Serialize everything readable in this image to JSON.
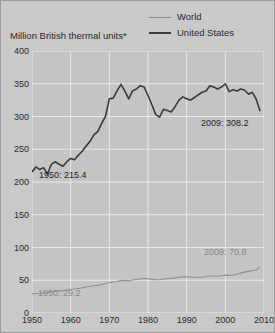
{
  "figure": {
    "axis_title": "Million British thermal units*",
    "background_color": "#c9c9c9",
    "plot_background_color": "#c4c4c4",
    "gridline_color": "#e8e8e8"
  },
  "legend": {
    "position": "top-right",
    "items": [
      {
        "label": "World",
        "color": "#8e8e8e",
        "swatch": "line-swatch-world"
      },
      {
        "label": "United States",
        "color": "#3a3a3a",
        "swatch": "line-swatch-united-states"
      }
    ]
  },
  "annotations": [
    {
      "name": "us-series-start-value",
      "text": "1950: 215.4",
      "color": "#1d1d1d",
      "series": "United States",
      "year": 1950,
      "value": 215.4
    },
    {
      "name": "us-series-end-value",
      "text": "2009: 308.2",
      "color": "#1d1d1d",
      "series": "United States",
      "year": 2009,
      "value": 308.2
    },
    {
      "name": "world-series-end-value",
      "text": "2009: 70.8",
      "color": "#8a8a8a",
      "series": "World",
      "year": 2009,
      "value": 70.8
    },
    {
      "name": "world-series-start-value",
      "text": "1950: 29.2",
      "color": "#8a8a8a",
      "series": "World",
      "year": 1950,
      "value": 29.2
    }
  ],
  "chart_data": {
    "type": "line",
    "title": "",
    "subtitle": "",
    "xlabel": "",
    "ylabel": "Million British thermal units*",
    "xlim": [
      1950,
      2010
    ],
    "ylim": [
      0,
      400
    ],
    "yticks": [
      0,
      50,
      100,
      150,
      200,
      250,
      300,
      350,
      400
    ],
    "xticks": [
      1950,
      1960,
      1970,
      1980,
      1990,
      2000,
      2010
    ],
    "grid": true,
    "legend_position": "upper right",
    "footnote_marker": "*",
    "x": [
      1950,
      1951,
      1952,
      1953,
      1954,
      1955,
      1956,
      1957,
      1958,
      1959,
      1960,
      1961,
      1962,
      1963,
      1964,
      1965,
      1966,
      1967,
      1968,
      1969,
      1970,
      1971,
      1972,
      1973,
      1974,
      1975,
      1976,
      1977,
      1978,
      1979,
      1980,
      1981,
      1982,
      1983,
      1984,
      1985,
      1986,
      1987,
      1988,
      1989,
      1990,
      1991,
      1992,
      1993,
      1994,
      1995,
      1996,
      1997,
      1998,
      1999,
      2000,
      2001,
      2002,
      2003,
      2004,
      2005,
      2006,
      2007,
      2008,
      2009
    ],
    "series": [
      {
        "name": "United States",
        "color": "#3a3a3a",
        "width": 1.6,
        "values": [
          215.4,
          223.0,
          219.0,
          222.0,
          212.0,
          227.0,
          231.0,
          227.0,
          224.0,
          231.0,
          236.0,
          234.0,
          241.0,
          247.0,
          255.0,
          262.0,
          272.0,
          277.0,
          289.0,
          300.0,
          327.0,
          328.0,
          339.0,
          349.0,
          339.0,
          327.0,
          339.0,
          342.0,
          347.0,
          345.0,
          332.0,
          318.0,
          303.0,
          299.0,
          311.0,
          309.0,
          307.0,
          315.0,
          325.0,
          330.0,
          327.0,
          325.0,
          329.0,
          333.0,
          337.0,
          339.0,
          347.0,
          345.0,
          342.0,
          345.0,
          350.0,
          338.0,
          341.0,
          339.0,
          342.0,
          340.0,
          334.0,
          337.0,
          326.0,
          308.2
        ]
      },
      {
        "name": "World",
        "color": "#8e8e8e",
        "width": 1.1,
        "values": [
          29.2,
          29.8,
          30.2,
          30.8,
          31.2,
          32.5,
          33.4,
          33.8,
          34.2,
          35.2,
          36.2,
          36.6,
          37.5,
          38.5,
          39.6,
          40.4,
          41.5,
          42.2,
          43.6,
          45.0,
          46.6,
          47.2,
          48.2,
          49.8,
          49.4,
          49.0,
          50.4,
          51.2,
          52.0,
          52.8,
          52.2,
          51.4,
          50.8,
          50.8,
          52.0,
          52.4,
          52.8,
          53.6,
          54.6,
          55.2,
          55.2,
          55.0,
          54.6,
          54.6,
          54.8,
          55.4,
          56.4,
          56.6,
          56.4,
          56.8,
          57.8,
          57.4,
          58.0,
          59.2,
          61.2,
          62.4,
          63.6,
          64.8,
          65.6,
          70.8
        ]
      }
    ]
  }
}
